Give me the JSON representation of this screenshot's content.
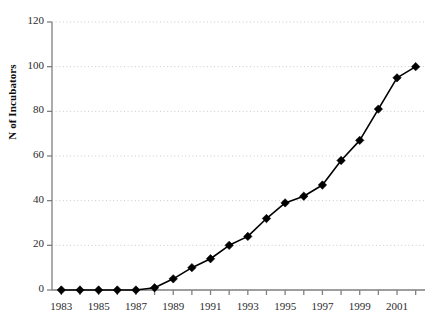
{
  "chart_data": {
    "type": "line",
    "title": "",
    "xlabel": "",
    "ylabel": "N of Incubators",
    "x": [
      1983,
      1984,
      1985,
      1986,
      1987,
      1988,
      1989,
      1990,
      1991,
      1992,
      1993,
      1994,
      1995,
      1996,
      1997,
      1998,
      1999,
      2000,
      2001,
      2002
    ],
    "values": [
      0,
      0,
      0,
      0,
      0,
      1,
      5,
      10,
      14,
      20,
      24,
      32,
      39,
      42,
      47,
      58,
      67,
      81,
      95,
      100
    ],
    "series": [
      {
        "name": "N of Incubators",
        "values": [
          0,
          0,
          0,
          0,
          0,
          1,
          5,
          10,
          14,
          20,
          24,
          32,
          39,
          42,
          47,
          58,
          67,
          81,
          95,
          100
        ]
      }
    ],
    "xlim": [
      1982.5,
      2002.5
    ],
    "ylim": [
      0,
      120
    ],
    "y_ticks": [
      0,
      20,
      40,
      60,
      80,
      100,
      120
    ],
    "y_tick_labels": [
      "0",
      "20",
      "40",
      "60",
      "80",
      "100",
      "120"
    ],
    "x_ticks": [
      1983,
      1984,
      1985,
      1986,
      1987,
      1988,
      1989,
      1990,
      1991,
      1992,
      1993,
      1994,
      1995,
      1996,
      1997,
      1998,
      1999,
      2000,
      2001,
      2002
    ],
    "x_tick_labels_shown": [
      "1983",
      "1985",
      "1987",
      "1989",
      "1991",
      "1993",
      "1995",
      "1997",
      "1999",
      "2001"
    ],
    "x_tick_labels_years": [
      1983,
      1985,
      1987,
      1989,
      1991,
      1993,
      1995,
      1997,
      1999,
      2001
    ],
    "grid": "horizontal-dotted",
    "legend": "none",
    "marker": "diamond",
    "marker_color": "#000000",
    "line_color": "#000000",
    "grid_color": "#c8c8c8",
    "axis_color": "#808080",
    "background": "#ffffff"
  }
}
